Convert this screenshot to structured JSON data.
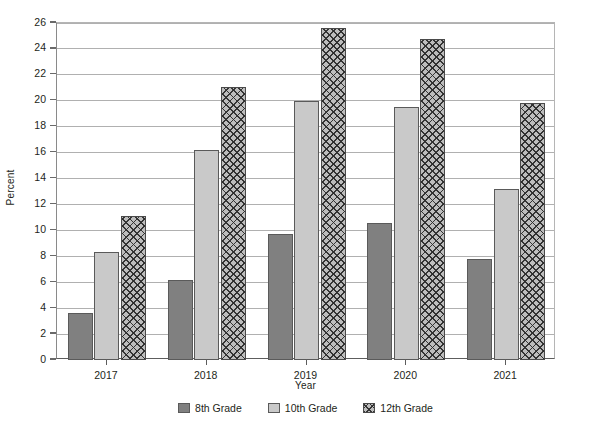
{
  "chart_data": {
    "type": "bar",
    "title": "",
    "xlabel": "Year",
    "ylabel": "Percent",
    "categories": [
      "2017",
      "2018",
      "2019",
      "2020",
      "2021"
    ],
    "series": [
      {
        "name": "8th Grade",
        "values": [
          3.6,
          6.2,
          9.7,
          10.6,
          7.8
        ],
        "color": "#808080",
        "pattern": "solid"
      },
      {
        "name": "10th Grade",
        "values": [
          8.3,
          16.2,
          20.0,
          19.5,
          13.2
        ],
        "color": "#c9c9c9",
        "pattern": "solid"
      },
      {
        "name": "12th Grade",
        "values": [
          11.1,
          21.1,
          25.6,
          24.8,
          19.8
        ],
        "color": "#bdbdbd",
        "pattern": "cross-hatch"
      }
    ],
    "ylim": [
      0,
      26
    ],
    "ytick_step": 2,
    "yticks": [
      0,
      2,
      4,
      6,
      8,
      10,
      12,
      14,
      16,
      18,
      20,
      22,
      24,
      26
    ],
    "ytick_labels": [
      "0",
      "2",
      "4",
      "6",
      "8",
      "10",
      "12",
      "14",
      "16",
      "18",
      "20",
      "22",
      "24",
      "26"
    ],
    "grid": true,
    "grid_axis": "y",
    "legend_position": "bottom",
    "legend_entries": [
      "8th Grade",
      "10th Grade",
      "12th Grade"
    ]
  },
  "axes": {
    "y_title": "Percent",
    "x_title": "Year"
  },
  "colors": {
    "grid": "#b0b0b0",
    "axis": "#5d5d5d",
    "text": "#231f20",
    "bar_8th": "#808080",
    "bar_10th": "#c9c9c9",
    "bar_12th": "#bdbdbd",
    "background": "#ffffff"
  }
}
